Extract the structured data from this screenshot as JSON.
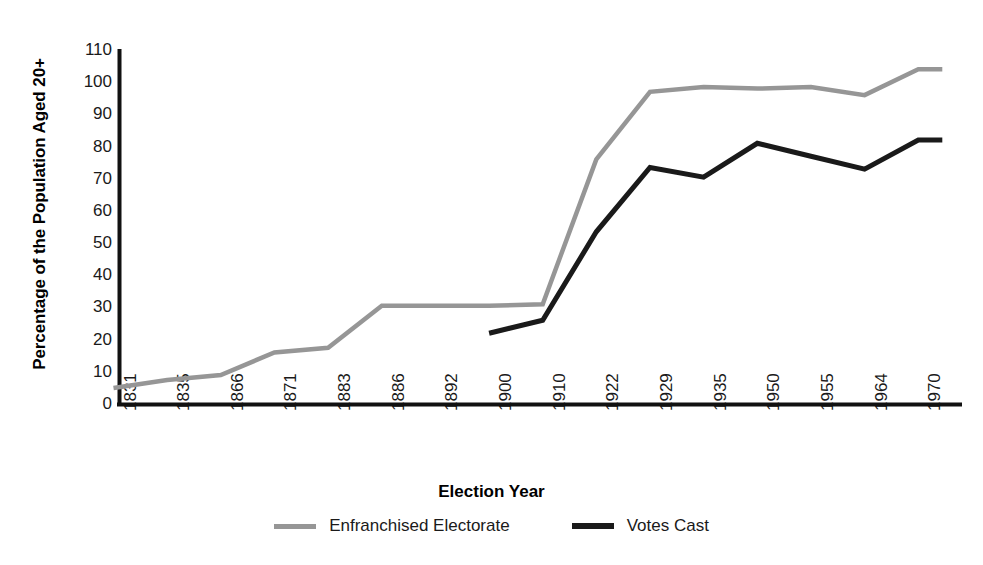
{
  "chart_data": {
    "type": "line",
    "title": "",
    "xlabel": "Election Year",
    "ylabel": "Percentage of the Population Aged 20+",
    "grid": false,
    "legend_position": "bottom-center",
    "ylim": [
      0,
      110
    ],
    "ytick_step": 10,
    "yticks": [
      "110",
      "100",
      "90",
      "80",
      "70",
      "60",
      "50",
      "40",
      "30",
      "20",
      "10",
      "0"
    ],
    "categories": [
      "1831",
      "1835",
      "1866",
      "1871",
      "1883",
      "1886",
      "1892",
      "1900",
      "1910",
      "1922",
      "1929",
      "1935",
      "1950",
      "1955",
      "1964",
      "1970"
    ],
    "series": [
      {
        "name": "Enfranchised Electorate",
        "color": "#969696",
        "values": [
          5,
          7.5,
          9,
          16,
          17.5,
          30.5,
          30.5,
          30.5,
          31,
          76,
          97,
          98.5,
          98,
          98.5,
          96,
          104
        ]
      },
      {
        "name": "Votes Cast",
        "color": "#1a1a1a",
        "values": [
          null,
          null,
          null,
          null,
          null,
          null,
          null,
          22,
          26,
          53.5,
          73.5,
          70.5,
          81,
          77,
          73,
          82
        ]
      }
    ],
    "annotations": []
  },
  "axis": {
    "y_title": "Percentage of the Population Aged 20+",
    "x_title": "Election Year"
  },
  "legend": {
    "items": [
      {
        "label": "Enfranchised Electorate",
        "color": "#969696",
        "weight": "thin"
      },
      {
        "label": "Votes Cast",
        "color": "#1a1a1a",
        "weight": "thick"
      }
    ]
  }
}
